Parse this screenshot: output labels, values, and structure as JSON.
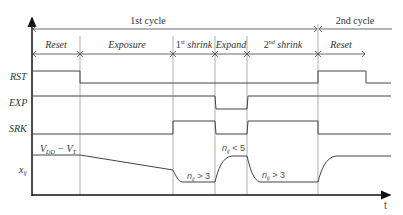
{
  "diagram": {
    "type": "timing-diagram",
    "cycles": [
      {
        "label": "1st cycle"
      },
      {
        "label": "2nd cycle"
      }
    ],
    "phases": [
      {
        "label": "Reset"
      },
      {
        "label": "Exposure"
      },
      {
        "label_base": "1",
        "label_sup": "st",
        "label_rest": " shrink"
      },
      {
        "label": "Expand"
      },
      {
        "label_base": "2",
        "label_sup": "nd",
        "label_rest": " shrink"
      },
      {
        "label": "Reset"
      }
    ],
    "signals": [
      {
        "name": "RST"
      },
      {
        "name": "EXP"
      },
      {
        "name": "SRK"
      }
    ],
    "analog": {
      "name_base": "x",
      "name_sub": "ij",
      "start_label_a": "V",
      "start_label_a_sub": "DD",
      "start_label_mid": " − ",
      "start_label_b": "V",
      "start_label_b_sub": "T",
      "annot1_base": "n",
      "annot1_sub": "ij",
      "annot1_rest": " > 3",
      "annot2_base": "n",
      "annot2_sub": "ij",
      "annot2_rest": " < 5",
      "annot3_base": "n",
      "annot3_sub": "ij",
      "annot3_rest": " > 3"
    },
    "time_axis_label": "t",
    "line_color": "#444444",
    "divider_color": "#999999"
  }
}
